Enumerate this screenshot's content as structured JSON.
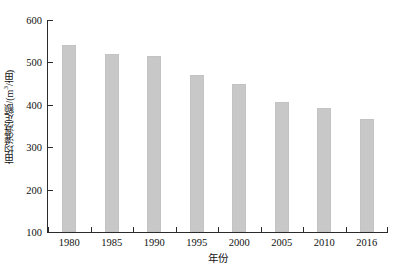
{
  "chart_data": {
    "type": "bar",
    "title": "",
    "subtitle": "",
    "xlabel": "年份",
    "ylabel": "亩均灌溉定额/(m³/亩)",
    "ylabel_parts": {
      "prefix": "亩均灌溉定额/(m",
      "superscript": "3",
      "suffix": "/亩)"
    },
    "categories": [
      "1980",
      "1985",
      "1990",
      "1995",
      "2000",
      "2005",
      "2010",
      "2016"
    ],
    "values": [
      540,
      519,
      514,
      470,
      449,
      406,
      393,
      367
    ],
    "series": [
      {
        "name": "亩均灌溉定额",
        "values": [
          540,
          519,
          514,
          470,
          449,
          406,
          393,
          367
        ]
      }
    ],
    "ylim": [
      100,
      600
    ],
    "yticks": [
      100,
      200,
      300,
      400,
      500,
      600
    ],
    "ytick_labels": [
      "100",
      "200",
      "300",
      "400",
      "500",
      "600"
    ],
    "grid": false,
    "legend": false,
    "legend_position": "none",
    "bar_color": "#c8c8c8",
    "axis_color": "#2b2b2b",
    "background_color": "#ffffff"
  }
}
